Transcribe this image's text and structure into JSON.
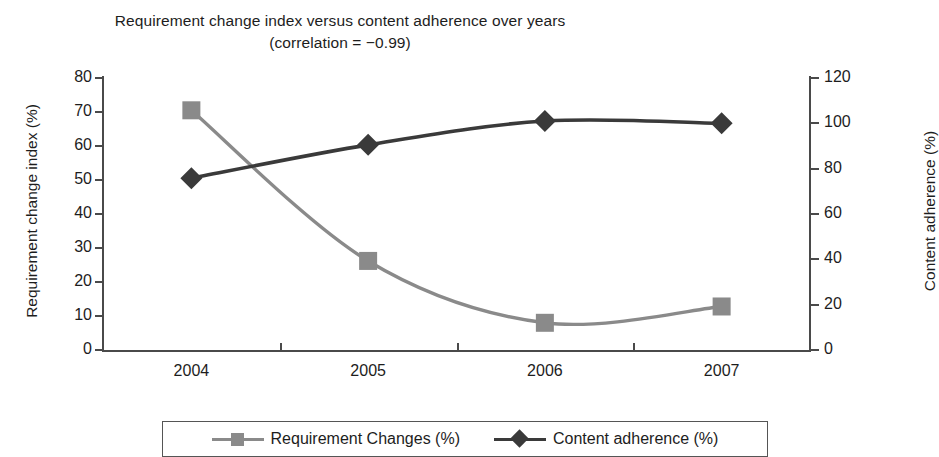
{
  "chart_data": {
    "type": "line",
    "title": "Requirement change index versus content adherence over years",
    "subtitle": "(correlation = −0.99)",
    "categories": [
      "2004",
      "2005",
      "2006",
      "2007"
    ],
    "xlabel": "",
    "series": [
      {
        "name": "Requirement Changes (%)",
        "axis": "left",
        "marker": "square",
        "color": "#8a8a8a",
        "values": [
          70.5,
          26.2,
          8.0,
          12.8
        ]
      },
      {
        "name": "Content adherence (%)",
        "axis": "right",
        "marker": "diamond",
        "color": "#3a3a3a",
        "values": [
          75.8,
          90.5,
          101.0,
          100.0
        ]
      }
    ],
    "left_axis": {
      "label": "Requirement change index (%)",
      "ylim": [
        0,
        80
      ],
      "ticks": [
        "0",
        "10",
        "20",
        "30",
        "40",
        "50",
        "60",
        "70",
        "80"
      ]
    },
    "right_axis": {
      "label": "Content adherence (%)",
      "ylim": [
        0,
        120
      ],
      "ticks": [
        "0",
        "20",
        "40",
        "60",
        "80",
        "100",
        "120"
      ]
    },
    "grid": false,
    "legend_position": "bottom"
  },
  "legend": {
    "items": [
      {
        "label": "Requirement Changes (%)",
        "marker": "square-marker",
        "color": "#8a8a8a"
      },
      {
        "label": "Content adherence (%)",
        "marker": "diamond-marker",
        "color": "#3a3a3a"
      }
    ]
  }
}
